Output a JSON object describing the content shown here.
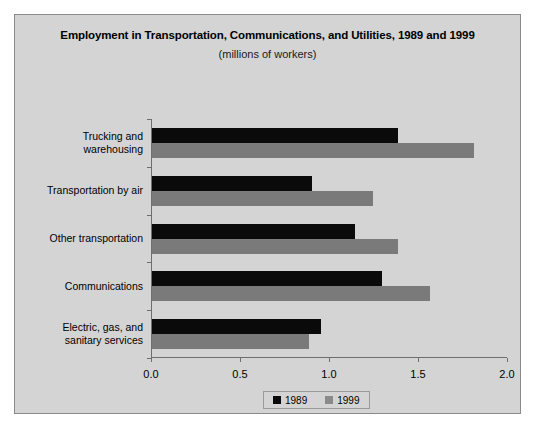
{
  "chart_data": {
    "type": "bar",
    "orientation": "horizontal",
    "title": "Employment in Transportation, Communications, and Utilities, 1989 and 1999",
    "subtitle": "(millions of workers)",
    "xlabel": "",
    "ylabel": "",
    "xlim": [
      0.0,
      2.0
    ],
    "xticks": [
      "0.0",
      "0.5",
      "1.0",
      "1.5",
      "2.0"
    ],
    "xtick_values": [
      0.0,
      0.5,
      1.0,
      1.5,
      2.0
    ],
    "grid": false,
    "legend_position": "bottom-center",
    "categories": [
      "Trucking and warehousing",
      "Transportation by air",
      "Other transportation",
      "Communications",
      "Electric, gas, and sanitary services"
    ],
    "category_lines": [
      [
        "Trucking and",
        "warehousing"
      ],
      [
        "Transportation by air"
      ],
      [
        "Other transportation"
      ],
      [
        "Communications"
      ],
      [
        "Electric, gas, and",
        "sanitary services"
      ]
    ],
    "series": [
      {
        "name": "1989",
        "color": "#0a0a0a",
        "values": [
          1.38,
          0.9,
          1.14,
          1.29,
          0.95
        ]
      },
      {
        "name": "1999",
        "color": "#7a7a7a",
        "values": [
          1.81,
          1.24,
          1.38,
          1.56,
          0.88
        ]
      }
    ]
  },
  "legend": {
    "entries": [
      {
        "label": "1989",
        "color": "#0a0a0a"
      },
      {
        "label": "1999",
        "color": "#8a8a8a"
      }
    ]
  },
  "colors": {
    "figure_background": "#d4d4d4",
    "page_background": "#ffffff",
    "axis": "#6e6e6e",
    "series_1989": "#0a0a0a",
    "series_1999": "#7a7a7a"
  }
}
